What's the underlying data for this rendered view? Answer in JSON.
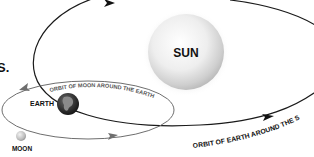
{
  "diagram": {
    "labels": {
      "sun": "SUN",
      "earth": "EARTH",
      "moon": "MOON",
      "fragment": "S."
    },
    "orbits": {
      "moon_orbit": "ORBIT OF MOON AROUND THE EARTH",
      "earth_orbit": "ORBIT OF EARTH AROUND THE SUN"
    },
    "colors": {
      "earth_orbit_line": "#1a1a1a",
      "moon_orbit_line": "#6e6e6e",
      "sun_light": "#ffffff",
      "sun_shadow": "#b8b8b8",
      "earth_dark": "#2a2a2a",
      "earth_land": "#8a8a8a",
      "moon_fill": "#c9c9c9"
    }
  }
}
